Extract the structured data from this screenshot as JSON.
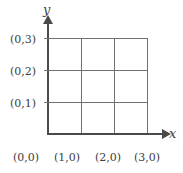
{
  "figure": {
    "background_color": "#ffffff",
    "line_color": "#6f6f6f",
    "axis_color": "#4a4a4a",
    "text_color": "#3d3d3d"
  },
  "axes": {
    "y_label": "y",
    "x_label": "x",
    "y_arrow": "arrow-up",
    "x_arrow": "arrow-right"
  },
  "y_axis_labels": [
    {
      "text": "(0,3)",
      "value": [
        0,
        3
      ]
    },
    {
      "text": "(0,2)",
      "value": [
        0,
        2
      ]
    },
    {
      "text": "(0,1)",
      "value": [
        0,
        1
      ]
    }
  ],
  "x_axis_labels": [
    {
      "text": "(0,0)",
      "value": [
        0,
        0
      ]
    },
    {
      "text": "(1,0)",
      "value": [
        1,
        0
      ]
    },
    {
      "text": "(2,0)",
      "value": [
        2,
        0
      ]
    },
    {
      "text": "(3,0)",
      "value": [
        3,
        0
      ]
    }
  ],
  "chart_data": {
    "type": "line",
    "title": "",
    "xlabel": "x",
    "ylabel": "y",
    "xlim": [
      0,
      3
    ],
    "ylim": [
      0,
      3
    ],
    "grid": true,
    "grid_rows": 3,
    "grid_cols": 3,
    "x_ticks": [
      0,
      1,
      2,
      3
    ],
    "y_ticks": [
      0,
      1,
      2,
      3
    ],
    "x_tick_labels": [
      "(0,0)",
      "(1,0)",
      "(2,0)",
      "(3,0)"
    ],
    "y_tick_labels": [
      "(0,0)",
      "(0,1)",
      "(0,2)",
      "(0,3)"
    ],
    "series": [],
    "legend": null,
    "annotations": []
  }
}
